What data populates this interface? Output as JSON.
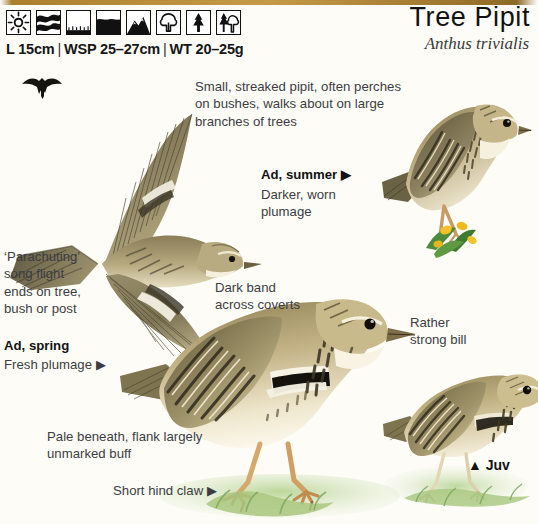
{
  "page": {
    "background_color": "#fdfcf7",
    "rule_color": "#b8892f"
  },
  "header": {
    "title": "Tree Pipit",
    "scientific_name": "Anthus trivialis",
    "measurements": {
      "length": "L 15cm",
      "wingspan": "WSP 25–27cm",
      "weight": "WT 20–25g",
      "separator": "|"
    },
    "habitat_icons": [
      {
        "name": "sun-icon",
        "label": "sun"
      },
      {
        "name": "marsh-icon",
        "label": "marsh"
      },
      {
        "name": "open-ground-icon",
        "label": "open ground"
      },
      {
        "name": "water-icon",
        "label": "water"
      },
      {
        "name": "mountain-icon",
        "label": "mountain"
      },
      {
        "name": "broadleaf-tree-icon",
        "label": "broadleaf wood"
      },
      {
        "name": "conifer-tree-icon",
        "label": "conifer wood"
      },
      {
        "name": "mixed-wood-icon",
        "label": "mixed wood"
      }
    ]
  },
  "captions": {
    "intro": "Small, streaked pipit, often perches\non bushes, walks about on large\nbranches of trees",
    "ad_summer_label": "Ad, summer ▶",
    "ad_summer_note": "Darker, worn\nplumage",
    "parachuting": "‘Parachuting’\nsong flight\nends on tree,\nbush or post",
    "ad_spring_label": "Ad, spring",
    "ad_spring_note": "Fresh plumage ▶",
    "dark_band": "Dark band\nacross coverts",
    "strong_bill": "Rather\nstrong bill",
    "pale_beneath": "Pale beneath, flank largely\nunmarked buff",
    "short_hind_claw": "Short hind claw ▶",
    "juv_label": "▲ Juv"
  },
  "illustrations": [
    {
      "name": "flight-silhouette",
      "label": "small flight silhouette"
    },
    {
      "name": "bird-ad-spring-flight",
      "label": "Ad, spring in flight"
    },
    {
      "name": "bird-ad-summer-perched",
      "label": "Ad, summer perched on stem"
    },
    {
      "name": "bird-adult-standing",
      "label": "adult standing on ground"
    },
    {
      "name": "bird-juvenile",
      "label": "juvenile standing"
    }
  ],
  "colors": {
    "plumage_dark": "#4a4431",
    "plumage_mid": "#8d7f5c",
    "plumage_light": "#cdbf99",
    "belly": "#f3ecd8",
    "buff": "#e2cf9e",
    "leg": "#c99a63",
    "grass": "#a9c77f",
    "flower": "#f2c12e",
    "text": "#3c3c42"
  }
}
